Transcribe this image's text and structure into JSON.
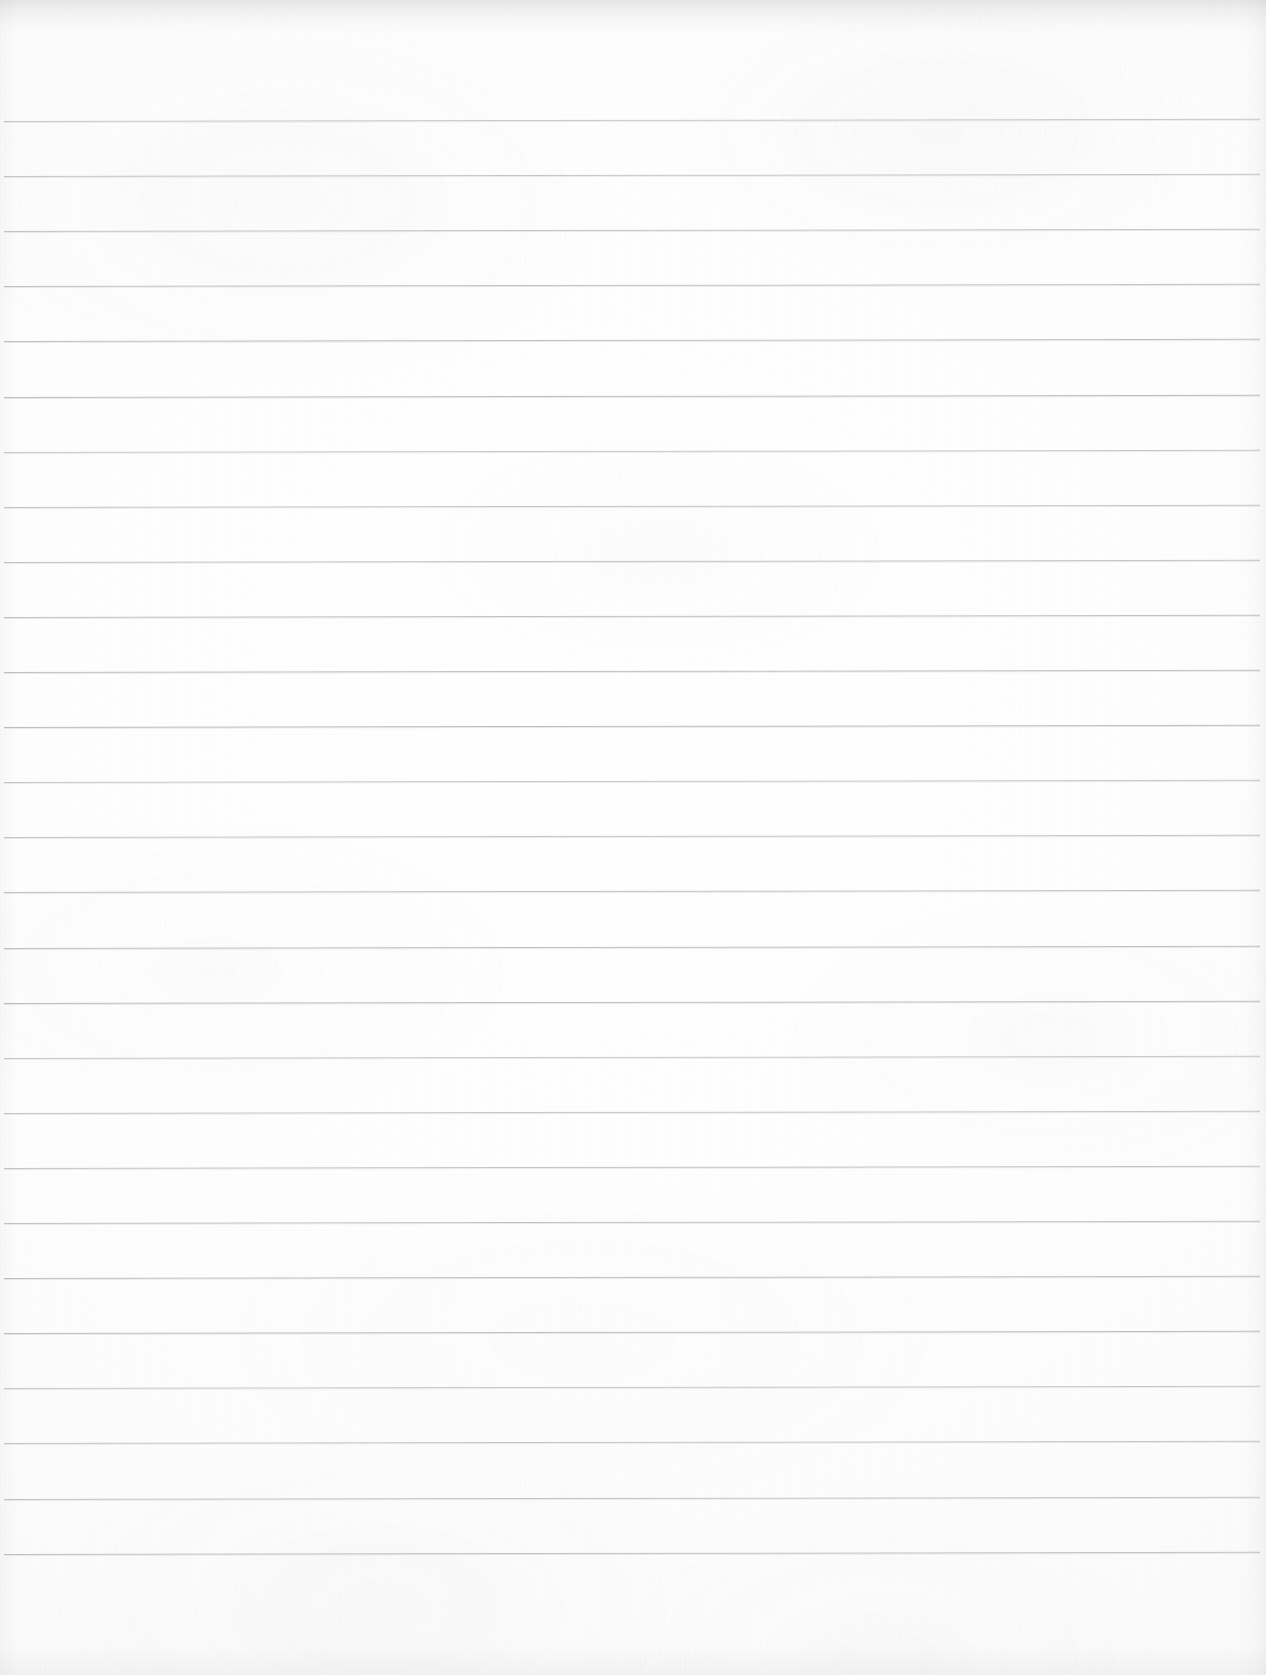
{
  "document": {
    "kind": "scanned-page",
    "title": "Blank Ruled Notebook Page",
    "content_text": "",
    "has_handwriting": false,
    "has_printed_text": false,
    "page_number_label": "",
    "margin_label": ""
  },
  "page": {
    "width": 1266,
    "height": 1675,
    "background_color": "#fdfdfd",
    "paper_tint": "#fbfbfb"
  },
  "ruling": {
    "style": "wide-ruled",
    "line_color": "#b9bdc0",
    "line_thickness_px": 1,
    "line_count": 27,
    "line_spacing_px": 55.1,
    "first_line_y": 121,
    "last_line_y": 1572,
    "line_start_x": 4,
    "line_end_x": 1260,
    "skew_degrees": -0.1,
    "has_vertical_margin_rule": false,
    "top_margin_px": 121,
    "bottom_margin_px": 103,
    "line_y_positions": [
      121,
      176.1,
      231.2,
      286.3,
      341.4,
      396.5,
      451.6,
      506.7,
      561.8,
      616.9,
      672.0,
      727.1,
      782.2,
      837.3,
      892.4,
      947.5,
      1002.6,
      1057.7,
      1112.8,
      1167.9,
      1223.0,
      1278.1,
      1333.2,
      1388.3,
      1443.4,
      1498.5,
      1553.6
    ]
  },
  "scan_artifacts": {
    "top_edge_shadow": true,
    "right_edge_shading": true,
    "paper_grain": true,
    "vignette": true
  }
}
